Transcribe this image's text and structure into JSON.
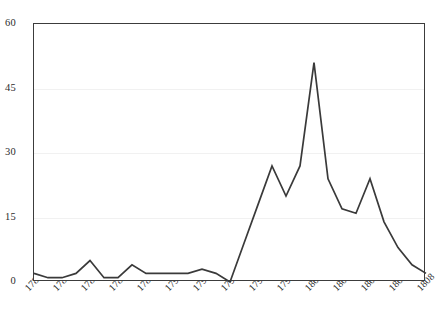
{
  "chart_data": {
    "type": "line",
    "title": "",
    "subtitle": "",
    "xlabel": "",
    "ylabel": "",
    "xlim": [
      1780,
      1808
    ],
    "ylim": [
      0,
      60
    ],
    "grid": true,
    "legend": null,
    "legend_position": "none",
    "line_color": "#3a3a3a",
    "axis_color": "#3c3c3c",
    "grid_color": "#f1f1f1",
    "background_color": "#ffffff",
    "y_ticks": [
      0,
      15,
      30,
      45,
      60
    ],
    "y_tick_labels": [
      "0",
      "15",
      "30",
      "45",
      "60"
    ],
    "x_ticks": [
      1780,
      1782,
      1784,
      1786,
      1788,
      1790,
      1792,
      1794,
      1796,
      1798,
      1800,
      1802,
      1804,
      1806,
      1808
    ],
    "x_tick_labels": [
      "1780",
      "1782",
      "1784",
      "1786",
      "1788",
      "1790",
      "1792",
      "1794",
      "1796",
      "1798",
      "1800",
      "1802",
      "1804",
      "1806",
      "1808"
    ],
    "x": [
      1780,
      1781,
      1782,
      1783,
      1784,
      1785,
      1786,
      1787,
      1788,
      1789,
      1790,
      1791,
      1792,
      1793,
      1794,
      1795,
      1796,
      1797,
      1798,
      1799,
      1800,
      1801,
      1802,
      1803,
      1804,
      1805,
      1806,
      1807,
      1808
    ],
    "values": [
      2,
      1,
      1,
      2,
      5,
      1,
      1,
      4,
      2,
      2,
      2,
      2,
      3,
      2,
      0,
      9,
      18,
      27,
      20,
      27,
      51,
      24,
      17,
      16,
      24,
      14,
      8,
      4,
      2
    ],
    "series": [
      {
        "name": "series-1",
        "values": [
          2,
          1,
          1,
          2,
          5,
          1,
          1,
          4,
          2,
          2,
          2,
          2,
          3,
          2,
          0,
          9,
          18,
          27,
          20,
          27,
          51,
          24,
          17,
          16,
          24,
          14,
          8,
          4,
          2
        ]
      }
    ]
  }
}
